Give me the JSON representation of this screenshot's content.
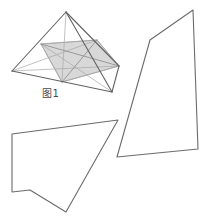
{
  "figure": {
    "caption": "图1",
    "caption_position": {
      "x": 42,
      "y": 88
    },
    "canvas": {
      "width": 203,
      "height": 219,
      "background": "#ffffff"
    },
    "colors": {
      "outline": "#6b6b6b",
      "outline_dark": "#555555",
      "inner_line": "#a8a8a8",
      "cross_section_fill": "#d6d6d6",
      "cross_section_stroke": "#9a9a9a",
      "background": "#ffffff"
    },
    "stroke_widths": {
      "outline": 1.1,
      "inner": 0.8,
      "cross_section": 0.8
    },
    "shapes": [
      {
        "name": "tetrahedron",
        "type": "solid-wireframe",
        "vertices": {
          "apex": [
            66,
            12
          ],
          "left": [
            12,
            71
          ],
          "front": [
            112,
            92
          ],
          "back": [
            119,
            66
          ]
        },
        "visible_edges": [
          [
            [
              66,
              12
            ],
            [
              12,
              71
            ]
          ],
          [
            [
              66,
              12
            ],
            [
              112,
              92
            ]
          ],
          [
            [
              66,
              12
            ],
            [
              119,
              66
            ]
          ],
          [
            [
              12,
              71
            ],
            [
              112,
              92
            ]
          ],
          [
            [
              112,
              92
            ],
            [
              119,
              66
            ]
          ]
        ],
        "hidden_edges": [
          [
            [
              12,
              71
            ],
            [
              119,
              66
            ]
          ]
        ]
      },
      {
        "name": "cross-section-quadrilateral",
        "type": "shaded-polygon",
        "points": [
          [
            41,
            44
          ],
          [
            97,
            40
          ],
          [
            119,
            66
          ],
          [
            62,
            82
          ]
        ],
        "fill": "#d6d6d6",
        "diagonals": [
          [
            [
              41,
              44
            ],
            [
              119,
              66
            ]
          ],
          [
            [
              97,
              40
            ],
            [
              62,
              82
            ]
          ]
        ]
      },
      {
        "name": "internal-construction-lines",
        "type": "lines",
        "segments": [
          [
            [
              41,
              44
            ],
            [
              112,
              92
            ]
          ],
          [
            [
              97,
              40
            ],
            [
              12,
              71
            ]
          ],
          [
            [
              12,
              71
            ],
            [
              119,
              66
            ]
          ],
          [
            [
              41,
              44
            ],
            [
              97,
              40
            ]
          ],
          [
            [
              62,
              82
            ],
            [
              119,
              66
            ]
          ],
          [
            [
              66,
              12
            ],
            [
              62,
              82
            ]
          ],
          [
            [
              41,
              44
            ],
            [
              62,
              82
            ]
          ],
          [
            [
              97,
              40
            ],
            [
              119,
              66
            ]
          ]
        ]
      },
      {
        "name": "right-quadrilateral",
        "type": "outline-polygon",
        "points": [
          [
            193,
            10
          ],
          [
            198,
            149
          ],
          [
            117,
            157
          ],
          [
            150,
            40
          ]
        ]
      },
      {
        "name": "bottom-left-pentagon",
        "type": "outline-polygon",
        "points": [
          [
            12,
            134
          ],
          [
            118,
            120
          ],
          [
            66,
            212
          ],
          [
            30,
            190
          ],
          [
            12,
            192
          ]
        ]
      }
    ]
  }
}
